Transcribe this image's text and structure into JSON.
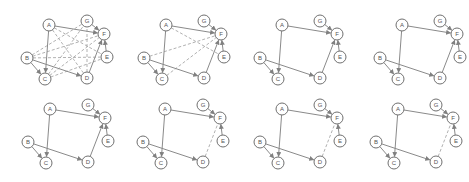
{
  "figure": {
    "node_radius": 6,
    "colors": {
      "node_stroke": "#707070",
      "node_fill": "#ffffff",
      "label": "#555555",
      "solid_edge": "#8a8a8a",
      "dashed_edge": "#a8a8a8"
    },
    "nodes": {
      "A": [
        49,
        25
      ],
      "G": [
        87,
        21
      ],
      "F": [
        104,
        34
      ],
      "E": [
        107,
        57
      ],
      "B": [
        27,
        58
      ],
      "C": [
        45,
        79
      ],
      "D": [
        87,
        78
      ]
    },
    "panels": [
      {
        "id": "panel-1",
        "offset": [
          0,
          0
        ],
        "solid_edges": [
          [
            "A",
            "C"
          ],
          [
            "A",
            "F"
          ],
          [
            "B",
            "C"
          ],
          [
            "B",
            "D"
          ],
          [
            "G",
            "F"
          ],
          [
            "E",
            "F"
          ],
          [
            "D",
            "F"
          ]
        ],
        "dashed_edges": [
          [
            "A",
            "D"
          ],
          [
            "A",
            "E"
          ],
          [
            "B",
            "G"
          ],
          [
            "B",
            "F"
          ],
          [
            "B",
            "E"
          ],
          [
            "C",
            "G"
          ],
          [
            "C",
            "F"
          ],
          [
            "C",
            "E"
          ],
          [
            "D",
            "G"
          ]
        ]
      },
      {
        "id": "panel-2",
        "offset": [
          117,
          0
        ],
        "solid_edges": [
          [
            "A",
            "C"
          ],
          [
            "A",
            "F"
          ],
          [
            "B",
            "C"
          ],
          [
            "B",
            "D"
          ],
          [
            "G",
            "F"
          ],
          [
            "E",
            "F"
          ],
          [
            "D",
            "F"
          ]
        ],
        "dashed_edges": [
          [
            "A",
            "E"
          ],
          [
            "B",
            "F"
          ],
          [
            "C",
            "F"
          ]
        ]
      },
      {
        "id": "panel-3",
        "offset": [
          233,
          0
        ],
        "solid_edges": [
          [
            "A",
            "C"
          ],
          [
            "A",
            "F"
          ],
          [
            "B",
            "C"
          ],
          [
            "B",
            "D"
          ],
          [
            "G",
            "F"
          ],
          [
            "E",
            "F"
          ],
          [
            "D",
            "F"
          ]
        ],
        "dashed_edges": []
      },
      {
        "id": "panel-4",
        "offset": [
          353,
          0
        ],
        "solid_edges": [
          [
            "A",
            "C"
          ],
          [
            "A",
            "F"
          ],
          [
            "B",
            "C"
          ],
          [
            "B",
            "D"
          ],
          [
            "G",
            "F"
          ],
          [
            "E",
            "F"
          ],
          [
            "D",
            "F"
          ]
        ],
        "dashed_edges": []
      },
      {
        "id": "panel-5",
        "offset": [
          1,
          84
        ],
        "solid_edges": [
          [
            "A",
            "C"
          ],
          [
            "A",
            "F"
          ],
          [
            "B",
            "C"
          ],
          [
            "B",
            "D"
          ],
          [
            "G",
            "F"
          ],
          [
            "E",
            "F"
          ],
          [
            "D",
            "F"
          ]
        ],
        "dashed_edges": []
      },
      {
        "id": "panel-6",
        "offset": [
          116,
          84
        ],
        "solid_edges": [
          [
            "A",
            "C"
          ],
          [
            "A",
            "F"
          ],
          [
            "B",
            "C"
          ],
          [
            "B",
            "D"
          ],
          [
            "G",
            "F"
          ],
          [
            "E",
            "F"
          ]
        ],
        "dashed_edges": [
          [
            "D",
            "F"
          ]
        ]
      },
      {
        "id": "panel-7",
        "offset": [
          233,
          84
        ],
        "solid_edges": [
          [
            "A",
            "C"
          ],
          [
            "A",
            "F"
          ],
          [
            "B",
            "C"
          ],
          [
            "B",
            "D"
          ],
          [
            "G",
            "F"
          ],
          [
            "E",
            "F"
          ]
        ],
        "dashed_edges": [
          [
            "D",
            "F"
          ]
        ]
      },
      {
        "id": "panel-8",
        "offset": [
          349,
          84
        ],
        "solid_edges": [
          [
            "A",
            "C"
          ],
          [
            "A",
            "F"
          ],
          [
            "B",
            "C"
          ],
          [
            "B",
            "D"
          ],
          [
            "G",
            "F"
          ],
          [
            "E",
            "F"
          ]
        ],
        "dashed_edges": [
          [
            "D",
            "F"
          ]
        ]
      }
    ]
  }
}
